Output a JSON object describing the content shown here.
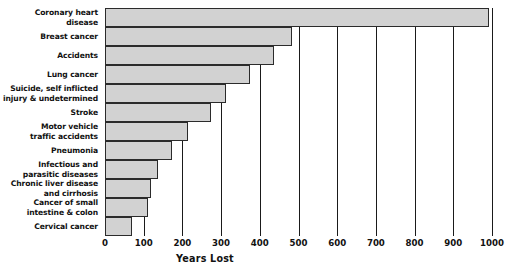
{
  "chart_data": {
    "type": "bar",
    "orientation": "horizontal",
    "title": "",
    "xlabel": "Years Lost",
    "ylabel": "",
    "xlim": [
      0,
      1000
    ],
    "grid": true,
    "legend": false,
    "bar_fill_color": "#d2d2d2",
    "bar_border_color": "#2b2b2b",
    "axis_color": "#1a1a1a",
    "xticks": [
      0,
      100,
      200,
      300,
      400,
      500,
      600,
      700,
      800,
      900,
      1000
    ],
    "xtick_labels": [
      "0",
      "100",
      "200",
      "300",
      "400",
      "500",
      "600",
      "700",
      "800",
      "900",
      "1000"
    ],
    "categories": [
      "Coronary heart\ndisease",
      "Breast cancer",
      "Accidents",
      "Lung cancer",
      "Suicide, self inflicted\ninjury & undetermined",
      "Stroke",
      "Motor vehicle\ntraffic accidents",
      "Pneumonia",
      "Infectious and\nparasitic diseases",
      "Chronic liver disease\nand cirrhosis",
      "Cancer of small\nintestine & colon",
      "Cervical cancer"
    ],
    "values": [
      993,
      483,
      437,
      375,
      313,
      274,
      214,
      173,
      136,
      119,
      111,
      70
    ]
  }
}
